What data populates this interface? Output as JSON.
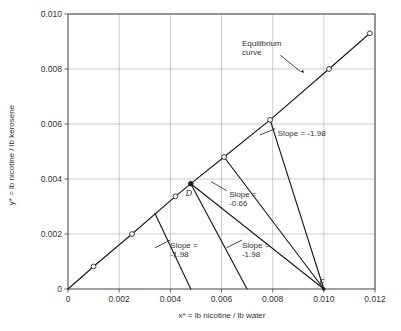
{
  "chart_data": {
    "type": "line",
    "title": "",
    "xlabel": "x* = lb nicotine / lb water",
    "ylabel": "y* = lb nicotine / lb kerosene",
    "xlim": [
      0,
      0.012
    ],
    "ylim": [
      0,
      0.01
    ],
    "xticks": [
      "0",
      "0.002",
      "0.004",
      "0.006",
      "0.008",
      "0.010",
      "0.012"
    ],
    "xtick_values": [
      0,
      0.002,
      0.004,
      0.006,
      0.008,
      0.01,
      0.012
    ],
    "yticks": [
      "0",
      "0.002",
      "0.004",
      "0.006",
      "0.008",
      "0.010"
    ],
    "ytick_values": [
      0,
      0.002,
      0.004,
      0.006,
      0.008,
      0.01
    ],
    "grid": true,
    "legend": "none",
    "series": [
      {
        "name": "Equilibrium curve",
        "type": "line",
        "marker": "open-circle",
        "x": [
          0,
          0.001,
          0.0025,
          0.0042,
          0.0048,
          0.0061,
          0.0079,
          0.0102,
          0.0118
        ],
        "y": [
          0,
          0.00082,
          0.002,
          0.00337,
          0.00383,
          0.0048,
          0.00615,
          0.008,
          0.0093
        ]
      },
      {
        "name": "Operating line 1 (slope -1.98)",
        "type": "line",
        "x": [
          0.0034,
          0.0048
        ],
        "y": [
          0.00275,
          0.0
        ]
      },
      {
        "name": "Operating line 2 (slope -1.98)",
        "type": "line",
        "x": [
          0.0048,
          0.007
        ],
        "y": [
          0.00383,
          0.0
        ]
      },
      {
        "name": "Operating line 3 (slope -1.98)",
        "type": "line",
        "x": [
          0.0061,
          0.01
        ],
        "y": [
          0.0048,
          0.0
        ]
      },
      {
        "name": "Operating line 4 (slope -1.98)",
        "type": "line",
        "x": [
          0.0079,
          0.01
        ],
        "y": [
          0.00615,
          0.0
        ]
      },
      {
        "name": "Operating line (slope -0.66)",
        "type": "line",
        "x": [
          0.0048,
          0.01
        ],
        "y": [
          0.00383,
          0.0
        ]
      }
    ],
    "point_labels": [
      {
        "label": "D",
        "x": 0.0048,
        "y": 0.00383
      },
      {
        "label": "F",
        "x": 0.01,
        "y": 0.0
      }
    ],
    "annotations": [
      {
        "text": "Equilibrium curve",
        "line1": "Equilibrium",
        "line2": "curve",
        "x": 0.0068,
        "y": 0.00885
      },
      {
        "text": "Slope = -1.98",
        "line1": "Slope = -1.98",
        "line2": "",
        "x": 0.0082,
        "y": 0.00555
      },
      {
        "text": "Slope = -0.66",
        "line1": "Slope =",
        "line2": "-0.66",
        "x": 0.0063,
        "y": 0.00335
      },
      {
        "text": "Slope = -1.98",
        "line1": "Slope =",
        "line2": "-1.98",
        "x": 0.004,
        "y": 0.0015
      },
      {
        "text": "Slope = -1.98",
        "line1": "Slope =",
        "line2": "-1.98",
        "x": 0.0068,
        "y": 0.0015
      }
    ],
    "colors": {
      "line": "#1a1a1a",
      "grid": "#b8b8b8",
      "axis": "#555555",
      "background": "#ffffff"
    }
  }
}
